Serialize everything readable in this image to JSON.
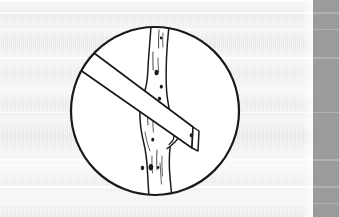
{
  "page": {
    "width": 339,
    "height": 217,
    "background_color": "#f2f3f3",
    "media_type": "scanned-paper-illustration"
  },
  "illustration": {
    "name": "board-nailed-to-tree-trunk",
    "description": "Line drawing of a wooden board nailed diagonally across a young tree trunk, framed inside a circle",
    "style": "black-ink-line-art",
    "line_color": "#1a1a1a",
    "fill_color": "#ffffff",
    "frame": {
      "shape": "circle",
      "center_x": 155,
      "center_y": 111,
      "radius": 85,
      "stroke_width": 2.2
    },
    "elements": [
      {
        "name": "tree-trunk",
        "label": "tree trunk",
        "orientation": "vertical",
        "has_bark_texture": true,
        "has_branch-stub": true
      },
      {
        "name": "wooden-board",
        "label": "wooden board",
        "orientation": "diagonal",
        "angle_degrees": -29,
        "has_nail_hole": true
      },
      {
        "name": "nail",
        "label": "nail",
        "count": 2
      }
    ]
  },
  "right_bar": {
    "name": "gray-edge-bar",
    "color": "#9a9b9b",
    "left": 313,
    "width": 26
  },
  "scan_bands": [
    {
      "top": 12,
      "height": 2
    },
    {
      "top": 29,
      "height": 1
    },
    {
      "top": 57,
      "height": 2
    },
    {
      "top": 112,
      "height": 1
    },
    {
      "top": 159,
      "height": 2
    },
    {
      "top": 186,
      "height": 2
    },
    {
      "top": 203,
      "height": 1
    }
  ]
}
